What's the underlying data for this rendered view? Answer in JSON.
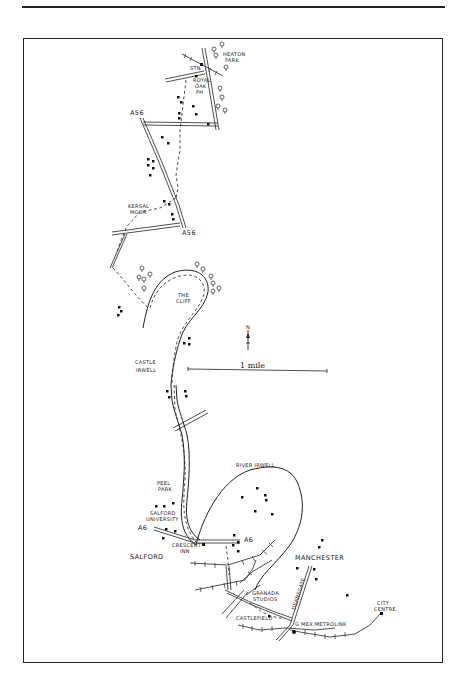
{
  "page": {
    "header_rule": true,
    "frame": {
      "x": 23,
      "y": 38,
      "width": 420,
      "height": 625
    }
  },
  "map": {
    "type": "hand-drawn walking route map",
    "labels": {
      "heaton_park": "HEATON PARK",
      "heaton_park_l1": "HEATON",
      "heaton_park_l2": "PARK",
      "station": "STN",
      "royal_oak_l1": "ROYAL",
      "royal_oak_l2": "OAK",
      "royal_oak_l3": "PH",
      "a56_north": "A56",
      "a56_south": "A56",
      "kersal_moor_l1": "KERSAL",
      "kersal_moor_l2": "MOOR",
      "the_cliff_l1": "THE",
      "the_cliff_l2": "CLIFF",
      "castle_irwell_l1": "CASTLE",
      "castle_irwell_l2": "IRWELL",
      "scale": "1 mile",
      "north": "N",
      "peel_park_l1": "PEEL",
      "peel_park_l2": "PARK",
      "salford_university_l1": "SALFORD",
      "salford_university_l2": "UNIVERSITY",
      "a6_west": "A6",
      "a6_east": "A6",
      "crescent_inn_l1": "CRESCENT",
      "crescent_inn_l2": "INN",
      "salford": "SALFORD",
      "river_irwell": "RIVER IRWELL",
      "manchester": "MANCHESTER",
      "granada_studios_l1": "GRANADA",
      "granada_studios_l2": "STUDIOS",
      "castlefield": "CASTLEFIELD",
      "deansgate": "DEANSGATE",
      "g_mex_metrolink": "G MEX METROLINK",
      "city_centre_l1": "CITY",
      "city_centre_l2": "CENTRE"
    },
    "colors": {
      "ink": "#222222",
      "paper": "#ffffff"
    }
  }
}
